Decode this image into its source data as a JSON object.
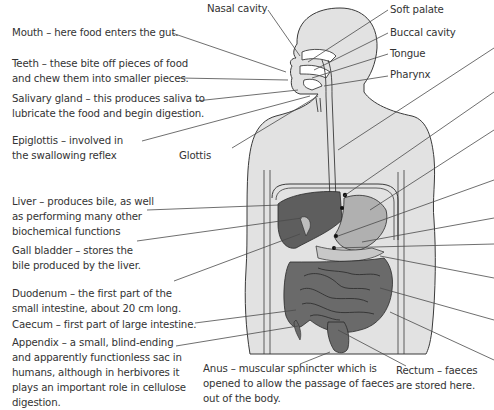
{
  "diagram": {
    "colors": {
      "body_fill": "#e2e2e2",
      "outline": "#3a3a3a",
      "organ_dark": "#5e5e5e",
      "organ_mid": "#8a8a8a",
      "organ_light": "#b8b8b8",
      "leader_line": "#4a4a4a",
      "text": "#333333"
    },
    "left_labels": [
      {
        "id": "mouth",
        "lines": [
          "Mouth – here food enters the gut."
        ]
      },
      {
        "id": "teeth",
        "lines": [
          "Teeth – these bite off pieces of food",
          "and chew them into smaller pieces."
        ]
      },
      {
        "id": "salivary",
        "lines": [
          "Salivary gland – this produces saliva to",
          "lubricate the food and begin digestion."
        ]
      },
      {
        "id": "epiglottis",
        "lines": [
          "Epiglottis – involved in",
          "the swallowing reflex"
        ]
      },
      {
        "id": "liver",
        "lines": [
          "Liver – produces bile, as well",
          "as performing many other",
          "biochemical functions"
        ]
      },
      {
        "id": "gall",
        "lines": [
          "Gall bladder – stores the",
          "bile produced by the liver."
        ]
      },
      {
        "id": "duodenum",
        "lines": [
          "Duodenum – the first part of the",
          "small intestine, about 20 cm long."
        ]
      },
      {
        "id": "caecum",
        "lines": [
          "Caecum – first part of large intestine."
        ]
      },
      {
        "id": "appendix",
        "lines": [
          "Appendix – a small, blind-ending",
          "and apparently functionless sac in",
          "humans, although in herbivores it",
          "plays an important role in cellulose",
          "digestion."
        ]
      }
    ],
    "top_labels": {
      "nasal": "Nasal cavity",
      "soft_palate": "Soft palate",
      "buccal": "Buccal cavity",
      "tongue": "Tongue",
      "pharynx": "Pharynx",
      "glottis": "Glottis"
    },
    "bottom_labels": {
      "anus": [
        "Anus – muscular sphincter which is",
        "opened to allow the passage of faeces",
        "out of the body."
      ],
      "rectum": [
        "Rectum – faeces",
        "are stored here."
      ]
    }
  }
}
